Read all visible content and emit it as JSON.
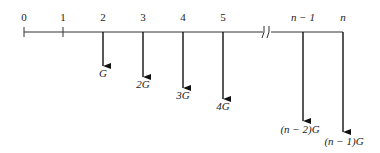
{
  "diagram": {
    "type": "cash-flow-diagram",
    "periods": [
      {
        "label": "0",
        "x": 24
      },
      {
        "label": "1",
        "x": 63
      },
      {
        "label": "2",
        "x": 103
      },
      {
        "label": "3",
        "x": 143
      },
      {
        "label": "4",
        "x": 183
      },
      {
        "label": "5",
        "x": 223
      },
      {
        "label": "n − 1",
        "x": 303
      },
      {
        "label": "n",
        "x": 343
      }
    ],
    "break_symbol": "//",
    "flows": [
      {
        "period": "2",
        "label": "G"
      },
      {
        "period": "3",
        "label": "2G"
      },
      {
        "period": "4",
        "label": "3G"
      },
      {
        "period": "5",
        "label": "4G"
      },
      {
        "period": "n − 1",
        "label": "(n − 2)G"
      },
      {
        "period": "n",
        "label": "(n − 1)G"
      }
    ]
  }
}
